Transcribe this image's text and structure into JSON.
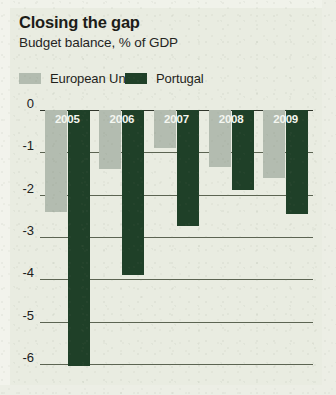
{
  "chart_data": {
    "type": "bar",
    "title": "Closing the gap",
    "subtitle": "Budget balance, % of GDP",
    "xlabel": "",
    "ylabel": "",
    "categories": [
      "2005",
      "2006",
      "2007",
      "2008",
      "2009"
    ],
    "series": [
      {
        "name": "European Union",
        "color": "#b3bcb0",
        "values": [
          -2.4,
          -1.4,
          -0.9,
          -1.35,
          -1.6
        ]
      },
      {
        "name": "Portugal",
        "color": "#1f4028",
        "values": [
          -6.05,
          -3.9,
          -2.75,
          -1.9,
          -2.45
        ]
      }
    ],
    "ylim": [
      -6,
      0
    ],
    "yticks": [
      "0",
      "-1",
      "-2",
      "-3",
      "-4",
      "-5",
      "-6"
    ],
    "ytick_values": [
      0,
      -1,
      -2,
      -3,
      -4,
      -5,
      -6
    ],
    "grid": true,
    "legend_position": "top-left",
    "background_color": "#e9ece1"
  }
}
